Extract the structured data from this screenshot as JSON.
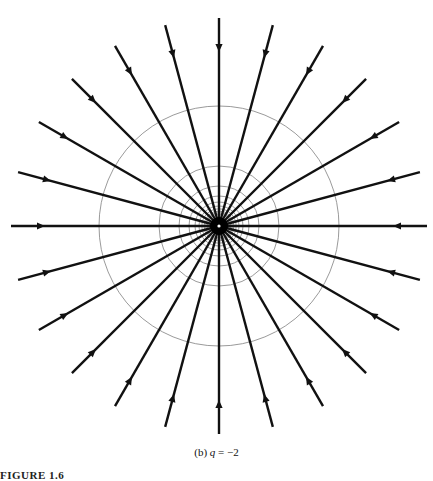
{
  "figure": {
    "type": "electric field lines and equipotentials of a point charge",
    "center": {
      "x": 219,
      "y": 226
    },
    "field_lines": {
      "count": 24,
      "angle_step_deg": 15,
      "length": 208,
      "arrow_distance_from_end": 30,
      "direction": "inward",
      "color": "#111111",
      "stroke_width": 2.4
    },
    "equipotentials": {
      "base_radius": 120,
      "radii_divisors": [
        1,
        2,
        3,
        4,
        5,
        6,
        7,
        8,
        9,
        10
      ],
      "color": "#808080",
      "stroke_width": 0.8
    },
    "center_marker_color": "#ffffff"
  },
  "caption": {
    "label": "(b)",
    "variable": "q",
    "equals": "=",
    "value": "−2"
  },
  "clipped_bottom_text": "FIGURE 1.6"
}
